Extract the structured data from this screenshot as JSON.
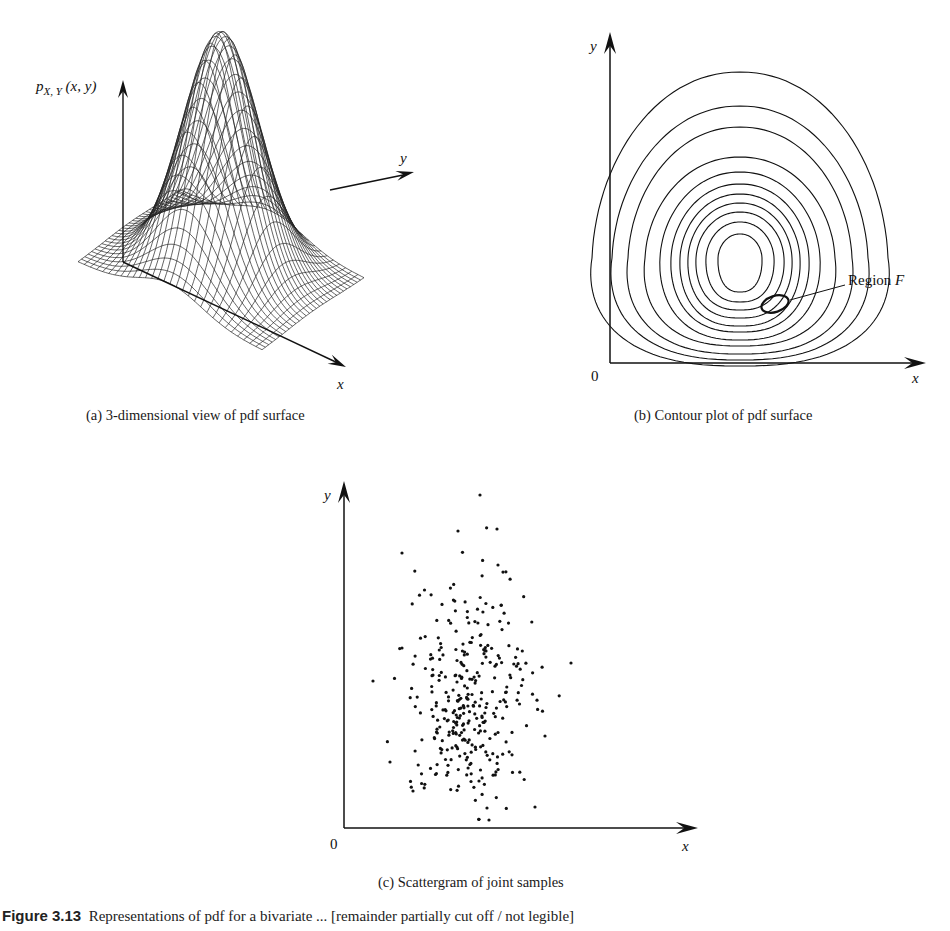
{
  "figure": {
    "caption_label": "Figure 3.13",
    "caption_text": "Representations of pdf for a bivariate ... [remainder partially cut off / not legible]"
  },
  "panels": {
    "a": {
      "caption": "(a) 3-dimensional view of pdf surface",
      "z_label": "p",
      "z_label_sub": "X, Y",
      "z_label_args": "(x, y)",
      "x_label": "x",
      "y_label": "y"
    },
    "b": {
      "caption": "(b) Contour plot of pdf surface",
      "x_label": "x",
      "y_label": "y",
      "origin_label": "0",
      "annotation": "Region",
      "annotation_var": "F"
    },
    "c": {
      "caption": "(c) Scattergram of joint samples",
      "x_label": "x",
      "y_label": "y",
      "origin_label": "0"
    }
  },
  "colors": {
    "ink": "#111111",
    "paper": "#ffffff",
    "grid": "#333333"
  },
  "chart_data": [
    {
      "type": "surface",
      "title": "(a) 3-dimensional view of pdf surface",
      "zlabel": "p_{X,Y}(x, y)",
      "xlabel": "x",
      "ylabel": "y",
      "description": "Wireframe mesh of a unimodal bivariate Gaussian pdf peaking at the center of a square grid floor"
    },
    {
      "type": "contour",
      "title": "(b) Contour plot of pdf surface",
      "xlabel": "x",
      "ylabel": "y",
      "origin": "0",
      "contour_count": 11,
      "annotation": "Region F",
      "description": "Nested egg-shaped contours elongated vertically, with a small ellipse marked Region F lower-right of center"
    },
    {
      "type": "scatter",
      "title": "(c) Scattergram of joint samples",
      "xlabel": "x",
      "ylabel": "y",
      "origin": "0",
      "approx_point_count": 330,
      "description": "Random samples from a bivariate Gaussian concentrated near the center, elongated in y"
    }
  ]
}
